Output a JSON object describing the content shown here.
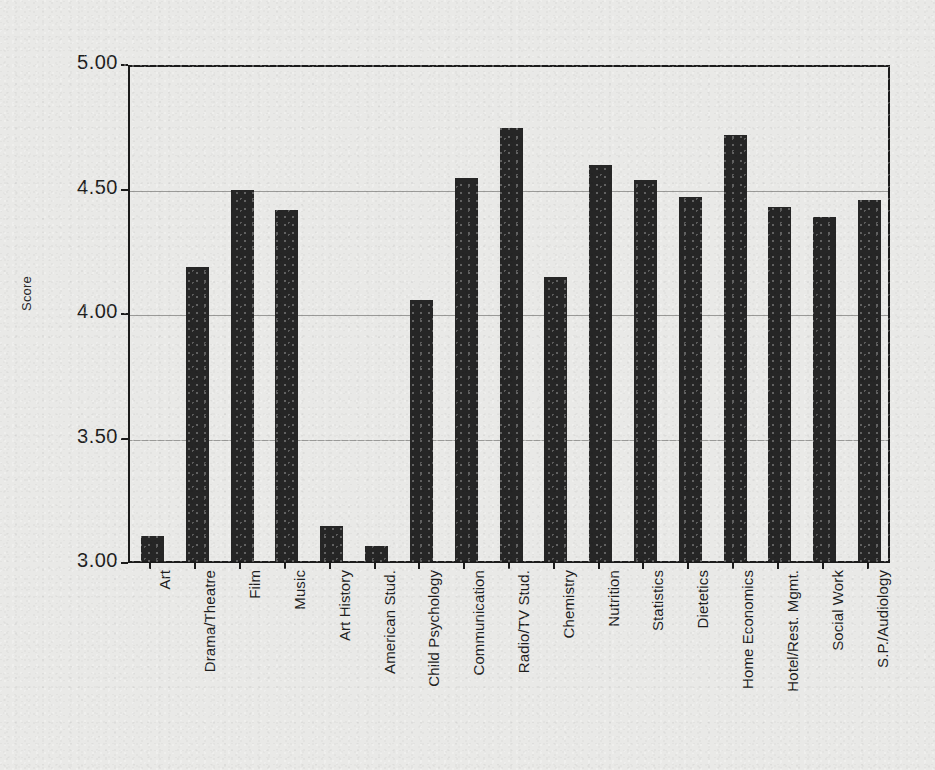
{
  "chart_data": {
    "type": "bar",
    "title": "",
    "subtitle": "",
    "xlabel": "",
    "ylabel": "Score",
    "ylim": [
      3.0,
      5.0
    ],
    "ytick_labels": [
      "5.00",
      "4.50",
      "4.00",
      "3.50",
      "3.00"
    ],
    "ytick_values": [
      5.0,
      4.5,
      4.0,
      3.5,
      3.0
    ],
    "grid": true,
    "grid_axis": "y",
    "legend": false,
    "legend_position": "none",
    "bar_color": "#262626",
    "axis_color": "#1b1b1b",
    "gridline_color": "#9a9a98",
    "background_color": "#e9e9e7",
    "categories": [
      "Art",
      "Drama/Theatre",
      "Film",
      "Music",
      "Art History",
      "American Stud.",
      "Child Psychology",
      "Communication",
      "Radio/TV Stud.",
      "Chemistry",
      "Nutrition",
      "Statistics",
      "Dietetics",
      "Home Economics",
      "Hotel/Rest. Mgmt.",
      "Social Work",
      "S.P./Audiology"
    ],
    "values": [
      3.1,
      4.18,
      4.49,
      4.41,
      3.14,
      3.06,
      4.05,
      4.54,
      4.74,
      4.14,
      4.59,
      4.53,
      4.46,
      4.71,
      4.42,
      4.38,
      4.45
    ]
  }
}
